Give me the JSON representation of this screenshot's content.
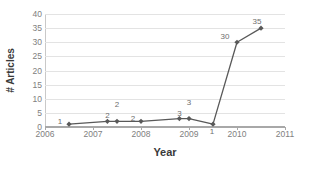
{
  "chart_data": {
    "type": "line",
    "title": "",
    "xlabel": "Year",
    "ylabel": "# Articles",
    "xlim": [
      2006,
      2011
    ],
    "ylim": [
      0,
      40
    ],
    "xticks": [
      2006,
      2007,
      2008,
      2009,
      2010,
      2011
    ],
    "xtick_labels": [
      "2006",
      "2007",
      "2008",
      "2009",
      "2010",
      "2011"
    ],
    "yticks": [
      0,
      5,
      10,
      15,
      20,
      25,
      30,
      35,
      40
    ],
    "ytick_labels": [
      "0",
      "5",
      "10",
      "15",
      "20",
      "25",
      "30",
      "35",
      "40"
    ],
    "grid": true,
    "legend": false,
    "series": [
      {
        "name": "# Articles",
        "color": "#595959",
        "marker": "diamond",
        "x": [
          2006.5,
          2007.3,
          2007.5,
          2008.0,
          2008.8,
          2009.0,
          2009.5,
          2010.0,
          2010.5
        ],
        "y": [
          1,
          2,
          2,
          2,
          3,
          3,
          1,
          30,
          35
        ],
        "point_labels": [
          "1",
          "2",
          "2",
          "2",
          "3",
          "3",
          "1",
          "30",
          "35"
        ]
      }
    ]
  },
  "axis_titles": {
    "x": "Year",
    "y": "# Articles"
  }
}
